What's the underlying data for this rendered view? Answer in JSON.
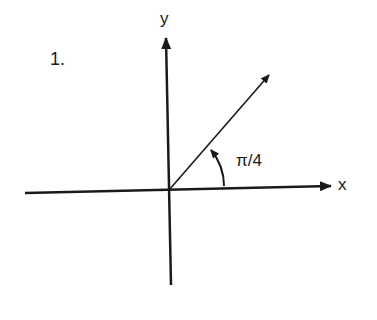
{
  "diagram": {
    "problem_number": "1.",
    "x_axis_label": "x",
    "y_axis_label": "y",
    "angle_label": "π/4",
    "angle_radians": "π/4",
    "angle_degrees": 45,
    "stroke_color": "#1a1a1a",
    "background_color": "#ffffff"
  }
}
